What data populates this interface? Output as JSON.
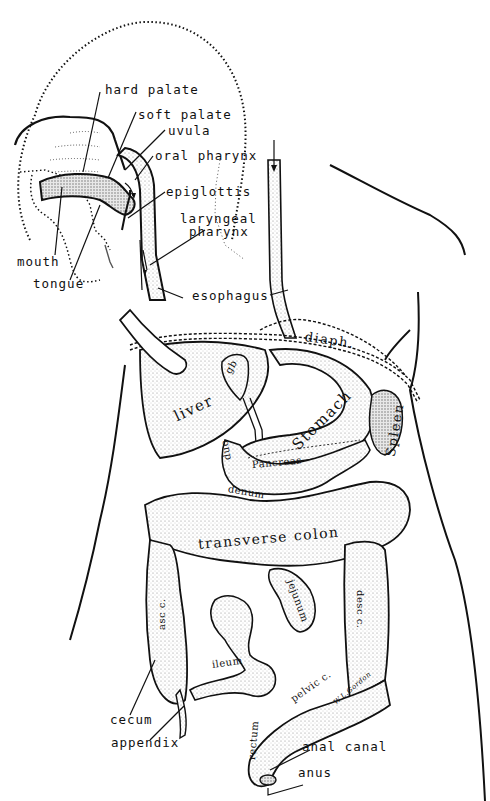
{
  "figure": {
    "stipple_color": "#9a9a9a",
    "line_color": "#111111",
    "background": "#ffffff"
  },
  "labels": {
    "head": {
      "hard_palate": "hard palate",
      "soft_palate": "soft palate",
      "uvula": "uvula",
      "oral_pharynx": "oral pharynx",
      "epiglottis": "epiglottis",
      "laryngeal_pharynx_line1": "laryngeal",
      "laryngeal_pharynx_line2": "pharynx",
      "mouth": "mouth",
      "tongue": "tongue",
      "esophagus": "esophagus"
    },
    "abdomen": {
      "diaph": "diaph.",
      "liver": "liver",
      "gb": "gb",
      "stomach": "Stomach",
      "spleen": "Spleen",
      "pancreas": "Pancreas",
      "duodenum_a": "duo",
      "duodenum_b": "denum",
      "transverse_colon": "transverse colon",
      "jejunum": "jejunum",
      "asc_colon": "asc c.",
      "desc_colon": "desc c.",
      "ileum": "ileum",
      "pelvic_colon": "pelvic c.",
      "rectum": "rectum",
      "cecum": "cecum",
      "appendix": "appendix",
      "anal_canal": "anal canal",
      "anus": "anus",
      "signature": "W.L.Gordon"
    }
  }
}
